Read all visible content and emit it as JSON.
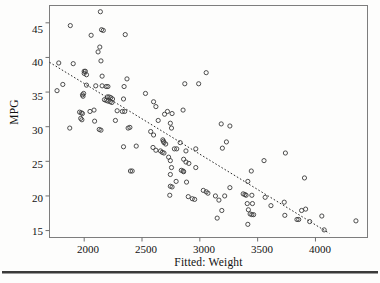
{
  "figure": {
    "background_color": "#fdfdfc",
    "frame_color": "#7d7d7d",
    "point_color": "#3b3b3b",
    "trend_color": "#2b2b2b"
  },
  "chart_data": {
    "type": "scatter",
    "title": "",
    "xlabel": "Fitted: Weight",
    "ylabel": "MPG",
    "xlim": [
      1700,
      4450
    ],
    "ylim": [
      14.0,
      47.5
    ],
    "xticks": [
      2000,
      2500,
      3000,
      3500,
      4000
    ],
    "yticks": [
      15,
      20,
      25,
      30,
      35,
      40,
      45
    ],
    "grid": false,
    "legend": null,
    "annotations": [],
    "trendline": {
      "type": "linear",
      "style": "dotted",
      "x": [
        1700,
        4120
      ],
      "y": [
        39.3,
        14.6
      ]
    },
    "points": [
      [
        2140,
        46.6
      ],
      [
        1880,
        44.6
      ],
      [
        2060,
        43.2
      ],
      [
        2150,
        44.0
      ],
      [
        2165,
        43.9
      ],
      [
        2355,
        43.3
      ],
      [
        2135,
        41.5
      ],
      [
        2120,
        40.8
      ],
      [
        2145,
        39.5
      ],
      [
        1780,
        39.2
      ],
      [
        1905,
        39.1
      ],
      [
        2000,
        38.0
      ],
      [
        2010,
        38.0
      ],
      [
        2000,
        37.7
      ],
      [
        2020,
        37.5
      ],
      [
        2155,
        37.3
      ],
      [
        2370,
        36.9
      ],
      [
        1815,
        36.1
      ],
      [
        2020,
        36.0
      ],
      [
        2100,
        35.9
      ],
      [
        2155,
        35.9
      ],
      [
        2190,
        35.8
      ],
      [
        2205,
        35.8
      ],
      [
        2345,
        35.8
      ],
      [
        2990,
        36.2
      ],
      [
        2870,
        36.2
      ],
      [
        3055,
        37.8
      ],
      [
        1765,
        35.2
      ],
      [
        1995,
        34.8
      ],
      [
        2530,
        34.8
      ],
      [
        2340,
        34.0
      ],
      [
        2200,
        34.3
      ],
      [
        2215,
        34.3
      ],
      [
        2230,
        34.2
      ],
      [
        2245,
        34.0
      ],
      [
        1985,
        34.6
      ],
      [
        1990,
        34.4
      ],
      [
        2175,
        33.9
      ],
      [
        2190,
        33.8
      ],
      [
        2205,
        33.7
      ],
      [
        2225,
        33.6
      ],
      [
        2240,
        33.5
      ],
      [
        2600,
        33.6
      ],
      [
        2620,
        32.9
      ],
      [
        2085,
        32.4
      ],
      [
        1960,
        32.1
      ],
      [
        1975,
        32.0
      ],
      [
        1985,
        31.9
      ],
      [
        2050,
        32.2
      ],
      [
        2330,
        32.2
      ],
      [
        2350,
        32.2
      ],
      [
        2285,
        32.3
      ],
      [
        2720,
        32.2
      ],
      [
        2760,
        31.9
      ],
      [
        2695,
        31.8
      ],
      [
        2855,
        32.4
      ],
      [
        3185,
        30.4
      ],
      [
        3260,
        30.1
      ],
      [
        1970,
        31.2
      ],
      [
        1980,
        31.0
      ],
      [
        2090,
        30.8
      ],
      [
        2270,
        30.9
      ],
      [
        2640,
        30.9
      ],
      [
        2745,
        30.5
      ],
      [
        2755,
        29.8
      ],
      [
        1875,
        29.8
      ],
      [
        2130,
        29.6
      ],
      [
        2145,
        29.5
      ],
      [
        2380,
        29.8
      ],
      [
        2395,
        29.9
      ],
      [
        2575,
        29.3
      ],
      [
        2600,
        28.8
      ],
      [
        2680,
        28.1
      ],
      [
        2685,
        27.9
      ],
      [
        2690,
        27.7
      ],
      [
        2705,
        27.5
      ],
      [
        2830,
        27.7
      ],
      [
        3230,
        27.8
      ],
      [
        3195,
        26.9
      ],
      [
        2340,
        27.1
      ],
      [
        2450,
        27.2
      ],
      [
        2595,
        27.0
      ],
      [
        2620,
        26.6
      ],
      [
        2660,
        26.5
      ],
      [
        2675,
        26.3
      ],
      [
        2690,
        26.2
      ],
      [
        2780,
        26.8
      ],
      [
        2800,
        26.8
      ],
      [
        2880,
        26.5
      ],
      [
        2965,
        26.8
      ],
      [
        3740,
        26.2
      ],
      [
        2730,
        25.6
      ],
      [
        2745,
        25.1
      ],
      [
        2860,
        25.3
      ],
      [
        2880,
        24.9
      ],
      [
        2905,
        24.7
      ],
      [
        2965,
        24.1
      ],
      [
        3555,
        25.1
      ],
      [
        2755,
        24.1
      ],
      [
        2400,
        23.6
      ],
      [
        2415,
        23.6
      ],
      [
        2840,
        23.7
      ],
      [
        2855,
        23.6
      ],
      [
        2860,
        23.5
      ],
      [
        2745,
        23.1
      ],
      [
        3445,
        23.6
      ],
      [
        3905,
        22.6
      ],
      [
        3415,
        22.1
      ],
      [
        2795,
        22.1
      ],
      [
        2885,
        22.0
      ],
      [
        2745,
        21.4
      ],
      [
        2760,
        21.3
      ],
      [
        3260,
        21.2
      ],
      [
        3030,
        20.8
      ],
      [
        3055,
        20.6
      ],
      [
        3070,
        20.4
      ],
      [
        3375,
        20.3
      ],
      [
        3390,
        20.2
      ],
      [
        3400,
        20.1
      ],
      [
        3450,
        20.1
      ],
      [
        3135,
        20.0
      ],
      [
        3215,
        20.0
      ],
      [
        3565,
        19.8
      ],
      [
        2740,
        20.1
      ],
      [
        2900,
        19.9
      ],
      [
        2935,
        19.6
      ],
      [
        2955,
        19.5
      ],
      [
        3165,
        19.4
      ],
      [
        3410,
        18.9
      ],
      [
        3455,
        18.9
      ],
      [
        3615,
        18.6
      ],
      [
        3730,
        19.1
      ],
      [
        3880,
        17.9
      ],
      [
        3915,
        18.1
      ],
      [
        3190,
        17.9
      ],
      [
        3420,
        18.0
      ],
      [
        3435,
        17.4
      ],
      [
        3450,
        17.3
      ],
      [
        3465,
        17.3
      ],
      [
        3735,
        17.2
      ],
      [
        3840,
        16.6
      ],
      [
        3855,
        16.6
      ],
      [
        3950,
        16.3
      ],
      [
        4055,
        17.1
      ],
      [
        4075,
        15.1
      ],
      [
        3415,
        15.9
      ],
      [
        3150,
        16.8
      ],
      [
        4350,
        16.4
      ]
    ]
  },
  "axes": {
    "y_ticks": [
      "45",
      "40",
      "35",
      "30",
      "25",
      "20",
      "15"
    ],
    "x_ticks": [
      "2000",
      "2500",
      "3000",
      "3500",
      "4000"
    ],
    "y_title": "MPG",
    "x_title": "Fitted: Weight"
  }
}
